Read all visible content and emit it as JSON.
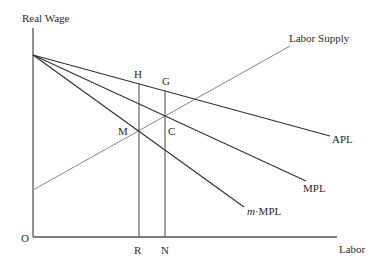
{
  "diagram": {
    "y_axis_label": "Real Wage",
    "x_axis_label": "Labor",
    "origin_label": "O",
    "curves": {
      "apl": {
        "label": "APL",
        "color": "#333333"
      },
      "mpl": {
        "label": "MPL",
        "color": "#333333"
      },
      "m_mpl": {
        "label_prefix": "m",
        "label_suffix": "·MPL",
        "color": "#333333"
      },
      "labor_supply": {
        "label": "Labor Supply",
        "color": "#777777"
      }
    },
    "points": {
      "H": "H",
      "G": "G",
      "M": "M",
      "C": "C",
      "R": "R",
      "N": "N"
    },
    "axis_color": "#555555"
  }
}
